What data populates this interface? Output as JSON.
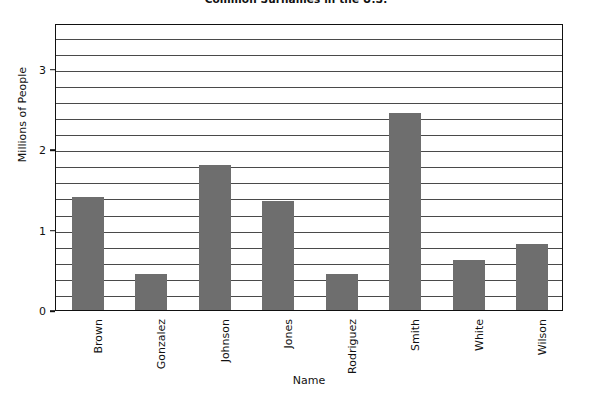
{
  "chart_data": {
    "type": "bar",
    "title": "Common Surnames in the U.S.",
    "xlabel": "Name",
    "ylabel": "Millions of People",
    "categories": [
      "Brown",
      "Gonzalez",
      "Johnson",
      "Jones",
      "Rodriguez",
      "Smith",
      "White",
      "Wilson"
    ],
    "values": [
      1.4,
      0.45,
      1.8,
      1.35,
      0.45,
      2.45,
      0.62,
      0.82
    ],
    "ylim": [
      0,
      3.57
    ],
    "yticks": [
      0,
      1,
      2,
      3
    ],
    "ytick_labels": [
      "0",
      "1",
      "2",
      "3"
    ],
    "minor_gridline_step": 0.2,
    "grid": true,
    "legend": "none",
    "bar_color": "#6e6e6e",
    "axis_color": "#111111",
    "gridline_color": "#4a4a4a",
    "background_color": "#ffffff"
  }
}
